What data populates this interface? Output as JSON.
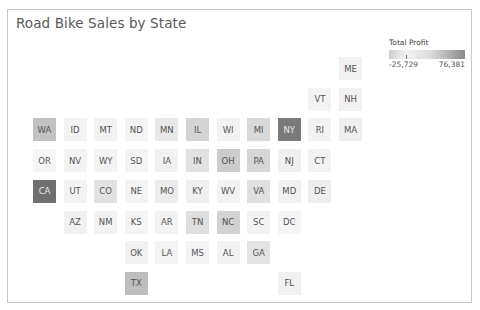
{
  "title": "Road Bike Sales by State",
  "legend": {
    "title": "Total Profit",
    "min_label": "-25,729",
    "max_label": "76,381"
  },
  "grid": {
    "x0": 33,
    "y0": 57,
    "step_x": 30.6,
    "step_y": 30.7
  },
  "tiles": [
    {
      "state": "ME",
      "col": 10,
      "row": 0,
      "color": "#f1f1f1",
      "text": "#555"
    },
    {
      "state": "VT",
      "col": 9,
      "row": 1,
      "color": "#f3f3f3",
      "text": "#555"
    },
    {
      "state": "NH",
      "col": 10,
      "row": 1,
      "color": "#f1f1f1",
      "text": "#555"
    },
    {
      "state": "WA",
      "col": 0,
      "row": 2,
      "color": "#c2c2c2",
      "text": "#555"
    },
    {
      "state": "ID",
      "col": 1,
      "row": 2,
      "color": "#f3f3f3",
      "text": "#555"
    },
    {
      "state": "MT",
      "col": 2,
      "row": 2,
      "color": "#f3f3f3",
      "text": "#555"
    },
    {
      "state": "ND",
      "col": 3,
      "row": 2,
      "color": "#f4f4f4",
      "text": "#555"
    },
    {
      "state": "MN",
      "col": 4,
      "row": 2,
      "color": "#e8e8e8",
      "text": "#555"
    },
    {
      "state": "IL",
      "col": 5,
      "row": 2,
      "color": "#d4d4d4",
      "text": "#555"
    },
    {
      "state": "WI",
      "col": 6,
      "row": 2,
      "color": "#f2f2f2",
      "text": "#555"
    },
    {
      "state": "MI",
      "col": 7,
      "row": 2,
      "color": "#d9d9d9",
      "text": "#555"
    },
    {
      "state": "NY",
      "col": 8,
      "row": 2,
      "color": "#7a7a7a",
      "text": "#e8e8e8"
    },
    {
      "state": "RI",
      "col": 9,
      "row": 2,
      "color": "#f3f3f3",
      "text": "#555"
    },
    {
      "state": "MA",
      "col": 10,
      "row": 2,
      "color": "#efefef",
      "text": "#555"
    },
    {
      "state": "OR",
      "col": 0,
      "row": 3,
      "color": "#f5f5f5",
      "text": "#555"
    },
    {
      "state": "NV",
      "col": 1,
      "row": 3,
      "color": "#f3f3f3",
      "text": "#555"
    },
    {
      "state": "WY",
      "col": 2,
      "row": 3,
      "color": "#f3f3f3",
      "text": "#555"
    },
    {
      "state": "SD",
      "col": 3,
      "row": 3,
      "color": "#f4f4f4",
      "text": "#555"
    },
    {
      "state": "IA",
      "col": 4,
      "row": 3,
      "color": "#f1f1f1",
      "text": "#555"
    },
    {
      "state": "IN",
      "col": 5,
      "row": 3,
      "color": "#e2e2e2",
      "text": "#555"
    },
    {
      "state": "OH",
      "col": 6,
      "row": 3,
      "color": "#cccccc",
      "text": "#555"
    },
    {
      "state": "PA",
      "col": 7,
      "row": 3,
      "color": "#d6d6d6",
      "text": "#555"
    },
    {
      "state": "NJ",
      "col": 8,
      "row": 3,
      "color": "#f0f0f0",
      "text": "#555"
    },
    {
      "state": "CT",
      "col": 9,
      "row": 3,
      "color": "#f2f2f2",
      "text": "#555"
    },
    {
      "state": "CA",
      "col": 0,
      "row": 4,
      "color": "#6f6f6f",
      "text": "#e8e8e8"
    },
    {
      "state": "UT",
      "col": 1,
      "row": 4,
      "color": "#f3f3f3",
      "text": "#555"
    },
    {
      "state": "CO",
      "col": 2,
      "row": 4,
      "color": "#e2e2e2",
      "text": "#555"
    },
    {
      "state": "NE",
      "col": 3,
      "row": 4,
      "color": "#f4f4f4",
      "text": "#555"
    },
    {
      "state": "MO",
      "col": 4,
      "row": 4,
      "color": "#ececec",
      "text": "#555"
    },
    {
      "state": "KY",
      "col": 5,
      "row": 4,
      "color": "#efefef",
      "text": "#555"
    },
    {
      "state": "WV",
      "col": 6,
      "row": 4,
      "color": "#f3f3f3",
      "text": "#555"
    },
    {
      "state": "VA",
      "col": 7,
      "row": 4,
      "color": "#e0e0e0",
      "text": "#555"
    },
    {
      "state": "MD",
      "col": 8,
      "row": 4,
      "color": "#f1f1f1",
      "text": "#555"
    },
    {
      "state": "DE",
      "col": 9,
      "row": 4,
      "color": "#eeeeee",
      "text": "#555"
    },
    {
      "state": "AZ",
      "col": 1,
      "row": 5,
      "color": "#f1f1f1",
      "text": "#555"
    },
    {
      "state": "NM",
      "col": 2,
      "row": 5,
      "color": "#f3f3f3",
      "text": "#555"
    },
    {
      "state": "KS",
      "col": 3,
      "row": 5,
      "color": "#f4f4f4",
      "text": "#555"
    },
    {
      "state": "AR",
      "col": 4,
      "row": 5,
      "color": "#f3f3f3",
      "text": "#555"
    },
    {
      "state": "TN",
      "col": 5,
      "row": 5,
      "color": "#dedede",
      "text": "#555"
    },
    {
      "state": "NC",
      "col": 6,
      "row": 5,
      "color": "#d2d2d2",
      "text": "#555"
    },
    {
      "state": "SC",
      "col": 7,
      "row": 5,
      "color": "#f3f3f3",
      "text": "#555"
    },
    {
      "state": "DC",
      "col": 8,
      "row": 5,
      "color": "#f5f5f5",
      "text": "#555"
    },
    {
      "state": "OK",
      "col": 3,
      "row": 6,
      "color": "#f1f1f1",
      "text": "#555"
    },
    {
      "state": "LA",
      "col": 4,
      "row": 6,
      "color": "#f4f4f4",
      "text": "#555"
    },
    {
      "state": "MS",
      "col": 5,
      "row": 6,
      "color": "#f4f4f4",
      "text": "#555"
    },
    {
      "state": "AL",
      "col": 6,
      "row": 6,
      "color": "#f2f2f2",
      "text": "#555"
    },
    {
      "state": "GA",
      "col": 7,
      "row": 6,
      "color": "#e3e3e3",
      "text": "#555"
    },
    {
      "state": "TX",
      "col": 3,
      "row": 7,
      "color": "#bdbdbd",
      "text": "#555"
    },
    {
      "state": "FL",
      "col": 8,
      "row": 7,
      "color": "#f1f1f1",
      "text": "#555"
    }
  ],
  "chart_data": {
    "type": "heatmap",
    "title": "Road Bike Sales by State",
    "subtype": "tile grid map (US states)",
    "color_legend": {
      "title": "Total Profit",
      "min": -25729,
      "max": 76381,
      "scale": "grayscale diverging (light near low/zero, dark high)"
    },
    "categories": [
      "ME",
      "VT",
      "NH",
      "WA",
      "ID",
      "MT",
      "ND",
      "MN",
      "IL",
      "WI",
      "MI",
      "NY",
      "RI",
      "MA",
      "OR",
      "NV",
      "WY",
      "SD",
      "IA",
      "IN",
      "OH",
      "PA",
      "NJ",
      "CT",
      "CA",
      "UT",
      "CO",
      "NE",
      "MO",
      "KY",
      "WV",
      "VA",
      "MD",
      "DE",
      "AZ",
      "NM",
      "KS",
      "AR",
      "TN",
      "NC",
      "SC",
      "DC",
      "OK",
      "LA",
      "MS",
      "AL",
      "GA",
      "TX",
      "FL"
    ],
    "relative_intensity_note": "Darkest: CA, NY; dark-medium: TX, WA; medium: OH, NC, IL, PA, MI; light-medium: TN, VA, IN, CO, GA, MN; remaining states near-white",
    "legend_position": "top-right",
    "grid": false
  }
}
